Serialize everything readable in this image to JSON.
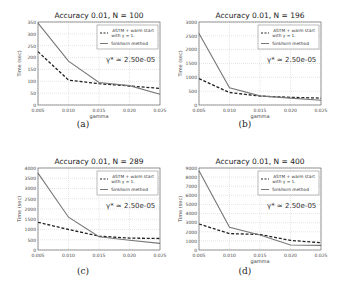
{
  "chart_data": [
    {
      "type": "line",
      "panel": "(a)",
      "title": "Accuracy 0.01, N = 100",
      "xlabel": "gamma",
      "ylabel": "Time (sec)",
      "x": [
        0.005,
        0.01,
        0.015,
        0.02,
        0.025
      ],
      "xticks": [
        "0.005",
        "0.010",
        "0.015",
        "0.020",
        "0.025"
      ],
      "ylim": [
        0,
        350
      ],
      "yticks": [
        "0",
        "50",
        "100",
        "150",
        "200",
        "250",
        "300",
        "350"
      ],
      "yvals": [
        0,
        50,
        100,
        150,
        200,
        250,
        300,
        350
      ],
      "series": [
        {
          "name": "ASTM + warm start with γ = 1.",
          "style": "dashed",
          "values": [
            225,
            105,
            90,
            80,
            70
          ]
        },
        {
          "name": "Sinkhorn method",
          "style": "solid",
          "values": [
            345,
            185,
            95,
            82,
            45
          ]
        }
      ],
      "annotation": "γ* ≈ 2.50e-05",
      "grid": true,
      "legend_position": "upper right"
    },
    {
      "type": "line",
      "panel": "(b)",
      "title": "Accuracy 0.01, N = 196",
      "xlabel": "gamma",
      "ylabel": "Time (sec)",
      "x": [
        0.005,
        0.01,
        0.015,
        0.02,
        0.025
      ],
      "xticks": [
        "0.005",
        "0.010",
        "0.015",
        "0.020",
        "0.025"
      ],
      "ylim": [
        0,
        3000
      ],
      "yticks": [
        "0",
        "500",
        "1000",
        "1500",
        "2000",
        "2500",
        "3000"
      ],
      "yvals": [
        0,
        500,
        1000,
        1500,
        2000,
        2500,
        3000
      ],
      "series": [
        {
          "name": "ASTM + warm start with γ = 1.",
          "style": "dashed",
          "values": [
            950,
            450,
            320,
            280,
            250
          ]
        },
        {
          "name": "Sinkhorn method",
          "style": "solid",
          "values": [
            2580,
            620,
            330,
            250,
            170
          ]
        }
      ],
      "annotation": "γ* ≈ 2.50e-05",
      "grid": true,
      "legend_position": "upper right"
    },
    {
      "type": "line",
      "panel": "(c)",
      "title": "Accuracy 0.01, N = 289",
      "xlabel": "",
      "ylabel": "Time (sec)",
      "x": [
        0.005,
        0.01,
        0.015,
        0.02,
        0.025
      ],
      "xticks": [
        "0.005",
        "0.010",
        "0.015",
        "0.020",
        "0.025"
      ],
      "ylim": [
        0,
        4000
      ],
      "yticks": [
        "0",
        "500",
        "1000",
        "1500",
        "2000",
        "2500",
        "3000",
        "3500",
        "4000"
      ],
      "yvals": [
        0,
        500,
        1000,
        1500,
        2000,
        2500,
        3000,
        3500,
        4000
      ],
      "series": [
        {
          "name": "ASTM + warm start with γ = 1.",
          "style": "dashed",
          "values": [
            1350,
            1000,
            680,
            580,
            560
          ]
        },
        {
          "name": "Sinkhorn method",
          "style": "solid",
          "values": [
            3750,
            1600,
            650,
            480,
            320
          ]
        }
      ],
      "annotation": "γ* ≈ 2.50e-05",
      "grid": true,
      "legend_position": "upper right"
    },
    {
      "type": "line",
      "panel": "(d)",
      "title": "Accuracy 0.01, N = 400",
      "xlabel": "gamma",
      "ylabel": "Time (sec)",
      "x": [
        0.005,
        0.01,
        0.015,
        0.02,
        0.025
      ],
      "xticks": [
        "0.005",
        "0.010",
        "0.015",
        "0.020",
        "0.025"
      ],
      "ylim": [
        0,
        9000
      ],
      "yticks": [
        "0",
        "1000",
        "2000",
        "3000",
        "4000",
        "5000",
        "6000",
        "7000",
        "8000",
        "9000"
      ],
      "yvals": [
        0,
        1000,
        2000,
        3000,
        4000,
        5000,
        6000,
        7000,
        8000,
        9000
      ],
      "series": [
        {
          "name": "ASTM + warm start with γ = 1.",
          "style": "dashed",
          "values": [
            2850,
            1800,
            1700,
            1050,
            800
          ]
        },
        {
          "name": "Sinkhorn method",
          "style": "solid",
          "values": [
            8700,
            2500,
            1650,
            550,
            500
          ]
        }
      ],
      "annotation": "γ* ≈ 2.50e-05",
      "grid": true,
      "legend_position": "upper right"
    }
  ],
  "legend": {
    "dashed_line1": "ASTM + warm start",
    "dashed_line2": "with γ = 1.",
    "solid": "Sinkhorn method"
  },
  "panels": [
    {
      "title": "Accuracy 0.01, N = 100",
      "caption": "(a)",
      "xlabel": "gamma",
      "annotation": "γ* ≈ 2.50e-05"
    },
    {
      "title": "Accuracy 0.01, N = 196",
      "caption": "(b)",
      "xlabel": "gamma",
      "annotation": "γ* ≈ 2.50e-05"
    },
    {
      "title": "Accuracy 0.01, N = 289",
      "caption": "(c)",
      "xlabel": "",
      "annotation": "γ* ≈ 2.50e-05"
    },
    {
      "title": "Accuracy 0.01, N = 400",
      "caption": "(d)",
      "xlabel": "gamma",
      "annotation": "γ* ≈ 2.50e-05"
    }
  ],
  "ylabel": "Time (sec)",
  "colors": {
    "dashed": "#222222",
    "solid": "#777777",
    "grid": "#cccccc",
    "axis": "#555555"
  }
}
